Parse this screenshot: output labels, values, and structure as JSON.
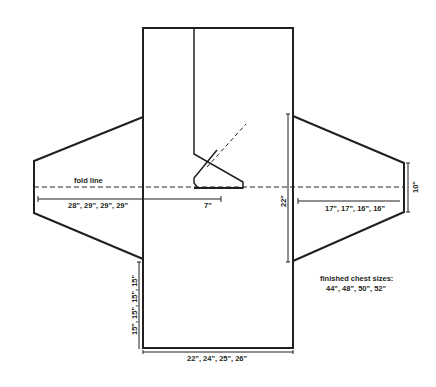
{
  "diagram": {
    "type": "knitting-schematic",
    "labels": {
      "fold_line": "fold line",
      "sleeve_length": "28\", 29\", 29\", 29\"",
      "neck_offset": "7\"",
      "armhole_depth": "22\"",
      "sleeve_width": "17\", 17\", 16\", 16\"",
      "cuff_width": "10\"",
      "side_length": "15\", 15\", 15\", 15\"",
      "body_width": "22\", 24\", 25\", 26\"",
      "sizes_heading": "finished chest sizes:",
      "sizes_values": "44\", 48\", 50\", 52\""
    },
    "colors": {
      "line": "#231f20",
      "background": "#ffffff"
    }
  }
}
